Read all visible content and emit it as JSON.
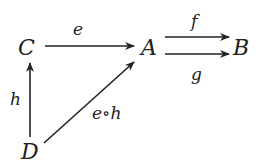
{
  "diagram": {
    "type": "commutative-diagram",
    "objects": {
      "C": "C",
      "A": "A",
      "B": "B",
      "D": "D"
    },
    "morphisms": {
      "e": {
        "label": "e",
        "from": "C",
        "to": "A"
      },
      "f": {
        "label": "f",
        "from": "A",
        "to": "B"
      },
      "g": {
        "label": "g",
        "from": "A",
        "to": "B"
      },
      "h": {
        "label": "h",
        "from": "D",
        "to": "C"
      },
      "eh": {
        "label": "e∘h",
        "from": "D",
        "to": "A"
      }
    }
  }
}
